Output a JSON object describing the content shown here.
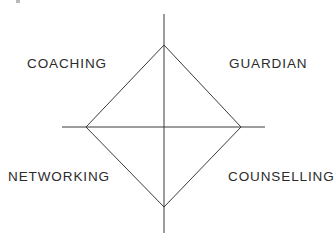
{
  "canvas": {
    "width": 336,
    "height": 246,
    "background": "#ffffff"
  },
  "diagram": {
    "type": "diamond-quadrant-diagram",
    "title": "",
    "line_color": "#3a3a3a",
    "line_width": 1,
    "center": {
      "x": 164,
      "y": 127
    },
    "vertices": {
      "top": {
        "x": 164,
        "y": 45
      },
      "right": {
        "x": 241,
        "y": 127
      },
      "bottom": {
        "x": 164,
        "y": 207
      },
      "left": {
        "x": 86,
        "y": 127
      }
    },
    "axes": {
      "vertical": {
        "x": 164,
        "y1": 14,
        "y2": 233
      },
      "horizontal": {
        "y": 127,
        "x1": 62,
        "x2": 265
      }
    },
    "labels": [
      {
        "id": "coaching",
        "text": "COACHING",
        "quadrant": "top-left"
      },
      {
        "id": "guardian",
        "text": "GUARDIAN",
        "quadrant": "top-right"
      },
      {
        "id": "networking",
        "text": "NETWORKING",
        "quadrant": "bottom-left"
      },
      {
        "id": "counselling",
        "text": "COUNSELLING",
        "quadrant": "bottom-right"
      }
    ],
    "label_color": "#2b2b2b"
  }
}
